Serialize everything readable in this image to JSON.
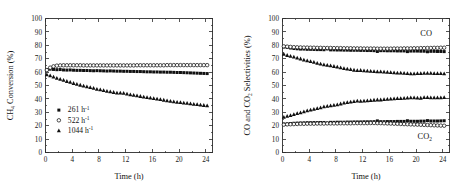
{
  "figure": {
    "panels": [
      "left",
      "right"
    ]
  },
  "chart_data": [
    {
      "panel": "left",
      "type": "scatter",
      "title": "",
      "xlabel": "Time (h)",
      "ylabel": "CH4 Conversion (%)",
      "ylabel_parts": {
        "pre": "CH",
        "sub": "4",
        "post": " Conversion (%)"
      },
      "xlim": [
        0,
        25
      ],
      "ylim": [
        0,
        100
      ],
      "xticks": [
        0,
        4,
        8,
        12,
        16,
        20,
        24
      ],
      "yticks": [
        0,
        10,
        20,
        30,
        40,
        50,
        60,
        70,
        80,
        90,
        100
      ],
      "grid": false,
      "legend_position": "lower-left",
      "series": [
        {
          "name": "261 h-1",
          "label_pre": "261 h",
          "label_sup": "-1",
          "marker": "filled-square",
          "color": "#101010",
          "x": [
            0.2,
            0.7,
            1.2,
            1.7,
            2.2,
            2.7,
            3.2,
            3.7,
            4.2,
            4.7,
            5.2,
            5.7,
            6.2,
            6.7,
            7.2,
            7.7,
            8.2,
            8.7,
            9.2,
            9.7,
            10.2,
            10.7,
            11.2,
            11.7,
            12.2,
            12.7,
            13.2,
            13.7,
            14.2,
            14.7,
            15.2,
            15.7,
            16.2,
            16.7,
            17.2,
            17.7,
            18.2,
            18.7,
            19.2,
            19.7,
            20.2,
            20.7,
            21.2,
            21.7,
            22.2,
            22.7,
            23.2,
            23.7,
            24.2
          ],
          "y": [
            61.8,
            62.2,
            62.0,
            61.8,
            61.9,
            61.6,
            61.5,
            61.6,
            61.4,
            61.3,
            61.3,
            61.2,
            61.2,
            61.1,
            61.0,
            61.1,
            61.0,
            60.9,
            60.8,
            60.9,
            60.8,
            60.7,
            60.7,
            60.6,
            60.6,
            60.5,
            60.5,
            60.4,
            60.4,
            60.3,
            60.2,
            60.2,
            60.1,
            60.1,
            60.0,
            60.0,
            59.9,
            59.9,
            59.8,
            59.7,
            59.7,
            59.6,
            59.5,
            59.4,
            59.3,
            59.2,
            59.1,
            59.0,
            58.9
          ]
        },
        {
          "name": "522 h-1",
          "label_pre": "522 h",
          "label_sup": "-1",
          "marker": "open-circle",
          "color": "#101010",
          "x": [
            0.2,
            0.7,
            1.2,
            1.7,
            2.2,
            2.7,
            3.2,
            3.7,
            4.2,
            4.7,
            5.2,
            5.7,
            6.2,
            6.7,
            7.2,
            7.7,
            8.2,
            8.7,
            9.2,
            9.7,
            10.2,
            10.7,
            11.2,
            11.7,
            12.2,
            12.7,
            13.2,
            13.7,
            14.2,
            14.7,
            15.2,
            15.7,
            16.2,
            16.7,
            17.2,
            17.7,
            18.2,
            18.7,
            19.2,
            19.7,
            20.2,
            20.7,
            21.2,
            21.7,
            22.2,
            22.7,
            23.2,
            23.7,
            24.2
          ],
          "y": [
            61.5,
            63.3,
            64.3,
            64.8,
            65.0,
            65.1,
            65.1,
            65.1,
            65.1,
            65.1,
            65.1,
            65.0,
            65.0,
            65.0,
            65.0,
            65.0,
            65.0,
            65.0,
            65.0,
            65.0,
            65.0,
            65.0,
            65.0,
            65.0,
            65.0,
            65.0,
            65.0,
            65.1,
            65.1,
            65.1,
            65.1,
            65.1,
            65.1,
            65.1,
            65.1,
            65.1,
            65.2,
            65.2,
            65.2,
            65.2,
            65.2,
            65.2,
            65.2,
            65.2,
            65.2,
            65.2,
            65.2,
            65.2,
            65.2
          ]
        },
        {
          "name": "1044 h-1",
          "label_pre": "1044 h",
          "label_sup": "-1",
          "marker": "filled-triangle",
          "color": "#101010",
          "x": [
            0.2,
            0.7,
            1.2,
            1.7,
            2.2,
            2.7,
            3.2,
            3.7,
            4.2,
            4.7,
            5.2,
            5.7,
            6.2,
            6.7,
            7.2,
            7.7,
            8.2,
            8.7,
            9.2,
            9.7,
            10.2,
            10.7,
            11.2,
            11.7,
            12.2,
            12.7,
            13.2,
            13.7,
            14.2,
            14.7,
            15.2,
            15.7,
            16.2,
            16.7,
            17.2,
            17.7,
            18.2,
            18.7,
            19.2,
            19.7,
            20.2,
            20.7,
            21.2,
            21.7,
            22.2,
            22.7,
            23.2,
            23.7,
            24.2
          ],
          "y": [
            58.2,
            57.4,
            56.5,
            55.6,
            54.8,
            54.0,
            53.2,
            52.5,
            51.7,
            51.0,
            50.4,
            49.8,
            49.2,
            48.6,
            48.0,
            47.4,
            46.9,
            46.4,
            45.9,
            45.4,
            45.0,
            44.6,
            44.5,
            44.3,
            43.8,
            43.3,
            42.8,
            42.4,
            42.0,
            41.6,
            41.2,
            40.8,
            40.4,
            40.0,
            39.6,
            39.2,
            38.8,
            38.4,
            38.0,
            37.7,
            37.4,
            37.1,
            36.8,
            36.5,
            36.2,
            35.9,
            35.6,
            35.3,
            35.0
          ]
        }
      ]
    },
    {
      "panel": "right",
      "type": "scatter",
      "title": "",
      "xlabel": "Time (h)",
      "ylabel": "CO and CO2 Selectivities (%)",
      "ylabel_parts": {
        "pre": "CO and CO",
        "sub": "2",
        "post": " Selectivities (%)"
      },
      "xlim": [
        0,
        25
      ],
      "ylim": [
        0,
        100
      ],
      "xticks": [
        0,
        4,
        8,
        12,
        16,
        20,
        24
      ],
      "yticks": [
        0,
        10,
        20,
        30,
        40,
        50,
        60,
        70,
        80,
        90,
        100
      ],
      "grid": false,
      "annotations": [
        {
          "text": "CO",
          "x": 21.5,
          "y": 87
        },
        {
          "text": "CO2",
          "text_pre": "CO",
          "text_sub": "2",
          "x": 21.3,
          "y": 10
        }
      ],
      "series": [
        {
          "name": "CO 261 h-1",
          "marker": "filled-square",
          "color": "#101010",
          "x": [
            0.2,
            0.7,
            1.2,
            1.7,
            2.2,
            2.7,
            3.2,
            3.7,
            4.2,
            4.7,
            5.2,
            5.7,
            6.2,
            6.7,
            7.2,
            7.7,
            8.2,
            8.7,
            9.2,
            9.7,
            10.2,
            10.7,
            11.2,
            11.7,
            12.2,
            12.7,
            13.2,
            13.7,
            14.2,
            14.7,
            15.2,
            15.7,
            16.2,
            16.7,
            17.2,
            17.7,
            18.2,
            18.7,
            19.2,
            19.7,
            20.2,
            20.7,
            21.2,
            21.7,
            22.2,
            22.7,
            23.2,
            23.7,
            24.2
          ],
          "y": [
            78.8,
            78.4,
            78.0,
            77.6,
            77.4,
            77.2,
            77.2,
            77.0,
            77.0,
            76.9,
            76.8,
            76.8,
            76.7,
            77.3,
            76.6,
            76.6,
            76.5,
            76.5,
            76.4,
            76.4,
            76.3,
            76.3,
            76.3,
            76.2,
            76.2,
            76.1,
            76.1,
            76.0,
            75.4,
            76.0,
            76.0,
            75.9,
            75.9,
            75.9,
            75.8,
            75.8,
            75.8,
            75.3,
            75.7,
            75.7,
            75.7,
            75.6,
            75.6,
            75.2,
            75.5,
            75.5,
            75.4,
            75.4,
            75.3
          ]
        },
        {
          "name": "CO 522 h-1",
          "marker": "open-circle",
          "color": "#101010",
          "x": [
            0.2,
            0.7,
            1.2,
            1.7,
            2.2,
            2.7,
            3.2,
            3.7,
            4.2,
            4.7,
            5.2,
            5.7,
            6.2,
            6.7,
            7.2,
            7.7,
            8.2,
            8.7,
            9.2,
            9.7,
            10.2,
            10.7,
            11.2,
            11.7,
            12.2,
            12.7,
            13.2,
            13.7,
            14.2,
            14.7,
            15.2,
            15.7,
            16.2,
            16.7,
            17.2,
            17.7,
            18.2,
            18.7,
            19.2,
            19.7,
            20.2,
            20.7,
            21.2,
            21.7,
            22.2,
            22.7,
            23.2,
            23.7,
            24.2
          ],
          "y": [
            79.2,
            79.0,
            78.8,
            78.6,
            78.5,
            78.4,
            78.3,
            78.3,
            78.2,
            78.2,
            78.1,
            78.1,
            78.0,
            78.0,
            78.0,
            77.9,
            77.9,
            77.9,
            77.8,
            77.8,
            77.8,
            77.7,
            77.7,
            77.7,
            77.6,
            77.6,
            77.6,
            77.6,
            77.5,
            77.5,
            77.5,
            77.5,
            77.5,
            77.6,
            77.6,
            77.6,
            77.7,
            77.7,
            77.7,
            77.8,
            77.8,
            77.9,
            77.9,
            78.0,
            78.0,
            78.1,
            78.1,
            78.2,
            78.2
          ]
        },
        {
          "name": "CO 1044 h-1",
          "marker": "filled-triangle",
          "color": "#101010",
          "x": [
            0.2,
            0.7,
            1.2,
            1.7,
            2.2,
            2.7,
            3.2,
            3.7,
            4.2,
            4.7,
            5.2,
            5.7,
            6.2,
            6.7,
            7.2,
            7.7,
            8.2,
            8.7,
            9.2,
            9.7,
            10.2,
            10.7,
            11.2,
            11.7,
            12.2,
            12.7,
            13.2,
            13.7,
            14.2,
            14.7,
            15.2,
            15.7,
            16.2,
            16.7,
            17.2,
            17.7,
            18.2,
            18.7,
            19.2,
            19.7,
            20.2,
            20.7,
            21.2,
            21.7,
            22.2,
            22.7,
            23.2,
            23.7,
            24.2
          ],
          "y": [
            73.4,
            72.6,
            72.0,
            71.4,
            70.6,
            70.0,
            69.2,
            68.6,
            68.0,
            67.4,
            66.8,
            66.2,
            65.6,
            65.2,
            64.8,
            64.4,
            64.0,
            63.4,
            62.8,
            62.4,
            62.0,
            61.6,
            61.3,
            61.4,
            61.2,
            61.0,
            60.8,
            60.6,
            60.4,
            60.4,
            60.2,
            60.0,
            59.8,
            59.6,
            59.4,
            59.4,
            59.2,
            59.0,
            58.9,
            58.9,
            59.0,
            59.1,
            59.2,
            59.2,
            59.2,
            59.1,
            59.0,
            59.0,
            58.9
          ]
        },
        {
          "name": "CO2 261 h-1",
          "marker": "filled-square",
          "color": "#101010",
          "x": [
            0.2,
            0.7,
            1.2,
            1.7,
            2.2,
            2.7,
            3.2,
            3.7,
            4.2,
            4.7,
            5.2,
            5.7,
            6.2,
            6.7,
            7.2,
            7.7,
            8.2,
            8.7,
            9.2,
            9.7,
            10.2,
            10.7,
            11.2,
            11.7,
            12.2,
            12.7,
            13.2,
            13.7,
            14.2,
            14.7,
            15.2,
            15.7,
            16.2,
            16.7,
            17.2,
            17.7,
            18.2,
            18.7,
            19.2,
            19.7,
            20.2,
            20.7,
            21.2,
            21.7,
            22.2,
            22.7,
            23.2,
            23.7,
            24.2
          ],
          "y": [
            21.2,
            21.4,
            21.6,
            21.8,
            21.9,
            22.0,
            22.1,
            22.2,
            22.2,
            22.3,
            22.3,
            22.4,
            22.4,
            22.0,
            22.5,
            22.5,
            22.6,
            22.6,
            22.6,
            22.7,
            22.7,
            22.8,
            22.8,
            22.8,
            22.9,
            22.9,
            22.9,
            23.0,
            23.6,
            23.0,
            23.0,
            23.1,
            23.1,
            23.1,
            23.2,
            23.2,
            23.2,
            23.7,
            23.3,
            23.3,
            23.3,
            23.4,
            23.4,
            23.8,
            23.5,
            23.5,
            23.5,
            23.6,
            23.7
          ]
        },
        {
          "name": "CO2 522 h-1",
          "marker": "open-circle",
          "color": "#101010",
          "x": [
            0.2,
            0.7,
            1.2,
            1.7,
            2.2,
            2.7,
            3.2,
            3.7,
            4.2,
            4.7,
            5.2,
            5.7,
            6.2,
            6.7,
            7.2,
            7.7,
            8.2,
            8.7,
            9.2,
            9.7,
            10.2,
            10.7,
            11.2,
            11.7,
            12.2,
            12.7,
            13.2,
            13.7,
            14.2,
            14.7,
            15.2,
            15.7,
            16.2,
            16.7,
            17.2,
            17.7,
            18.2,
            18.7,
            19.2,
            19.7,
            20.2,
            20.7,
            21.2,
            21.7,
            22.2,
            22.7,
            23.2,
            23.7,
            24.2
          ],
          "y": [
            20.8,
            21.0,
            21.1,
            21.2,
            21.3,
            21.4,
            21.4,
            21.5,
            21.5,
            21.5,
            21.6,
            21.6,
            21.6,
            21.7,
            21.7,
            21.7,
            21.7,
            21.8,
            21.8,
            21.8,
            21.8,
            21.9,
            21.9,
            21.9,
            21.9,
            21.9,
            22.0,
            22.0,
            21.9,
            21.9,
            21.8,
            21.7,
            21.6,
            21.5,
            21.4,
            21.3,
            21.2,
            21.1,
            21.0,
            20.9,
            20.8,
            20.7,
            20.6,
            20.5,
            20.4,
            20.3,
            20.2,
            20.1,
            20.0
          ]
        },
        {
          "name": "CO2 1044 h-1",
          "marker": "filled-triangle",
          "color": "#101010",
          "x": [
            0.2,
            0.7,
            1.2,
            1.7,
            2.2,
            2.7,
            3.2,
            3.7,
            4.2,
            4.7,
            5.2,
            5.7,
            6.2,
            6.7,
            7.2,
            7.7,
            8.2,
            8.7,
            9.2,
            9.7,
            10.2,
            10.7,
            11.2,
            11.7,
            12.2,
            12.7,
            13.2,
            13.7,
            14.2,
            14.7,
            15.2,
            15.7,
            16.2,
            16.7,
            17.2,
            17.7,
            18.2,
            18.7,
            19.2,
            19.7,
            20.2,
            20.7,
            21.2,
            21.7,
            22.2,
            22.7,
            23.2,
            23.7,
            24.2
          ],
          "y": [
            26.4,
            27.2,
            27.8,
            28.4,
            29.2,
            29.8,
            30.6,
            31.2,
            31.8,
            32.4,
            33.0,
            33.6,
            34.2,
            34.6,
            35.0,
            35.4,
            35.8,
            36.4,
            37.0,
            37.4,
            37.8,
            38.2,
            38.5,
            38.4,
            38.6,
            38.8,
            39.0,
            39.2,
            39.4,
            39.4,
            39.6,
            39.8,
            40.0,
            40.2,
            40.4,
            40.4,
            40.6,
            40.8,
            40.9,
            40.9,
            40.8,
            40.7,
            41.2,
            41.2,
            41.0,
            40.9,
            41.0,
            41.0,
            41.1
          ]
        }
      ]
    }
  ]
}
